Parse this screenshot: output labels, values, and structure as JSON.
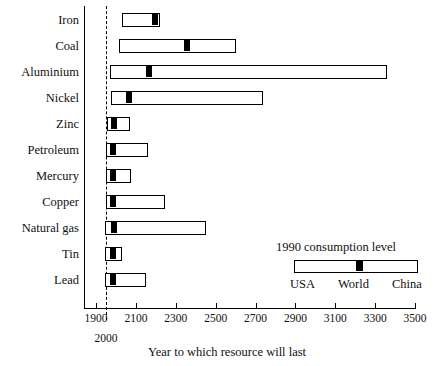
{
  "chart_data": {
    "type": "bar",
    "title": "",
    "xlabel": "Year to which resource will last",
    "ylabel": "",
    "xlim": [
      1900,
      3500
    ],
    "xticks": [
      1900,
      2100,
      2300,
      2500,
      2700,
      2900,
      3100,
      3300,
      3500
    ],
    "xticklabels": [
      "1900",
      "2100",
      "2300",
      "2500",
      "2700",
      "2900",
      "3100",
      "3300",
      "3500"
    ],
    "reference_line": {
      "value": 2000,
      "label": "2000",
      "style": "dashed"
    },
    "grid": false,
    "orientation": "horizontal",
    "legend": {
      "position": "inside-lower-right",
      "title": "1990 consumption level",
      "labels": [
        "USA",
        "World",
        "China"
      ]
    },
    "note": "Each bar spans USA-consumption-rate (left end) to China-consumption-rate (right end); the black block marks the World consumption rate.",
    "categories": [
      "Iron",
      "Coal",
      "Aluminium",
      "Nickel",
      "Zinc",
      "Petroleum",
      "Mercury",
      "Copper",
      "Natural gas",
      "Tin",
      "Lead"
    ],
    "series": [
      {
        "name": "USA rate (bar start)",
        "values": [
          2030,
          2015,
          1970,
          1975,
          1955,
          1950,
          1950,
          1950,
          1945,
          1945,
          1945
        ]
      },
      {
        "name": "World rate (black marker)",
        "values": [
          2190,
          2350,
          2160,
          2060,
          1985,
          1980,
          1980,
          1980,
          1985,
          1980,
          1980
        ]
      },
      {
        "name": "China rate (bar end)",
        "values": [
          2220,
          2600,
          3360,
          2740,
          2070,
          2160,
          2075,
          2245,
          2450,
          2030,
          2150
        ]
      }
    ]
  },
  "axis": {
    "x_title": "Year to which resource will last"
  }
}
